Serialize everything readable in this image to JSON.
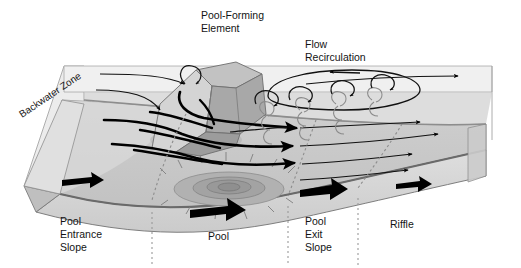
{
  "figure": {
    "title_visible": false,
    "type": "block-diagram",
    "background_color": "#ffffff"
  },
  "labels": {
    "pool_forming_element": {
      "line1": "Pool-Forming",
      "line2": "Element"
    },
    "flow_recirculation": {
      "line1": "Flow",
      "line2": "Recirculation"
    },
    "backwater_zone": "Backwater Zone",
    "pool_entrance_slope": {
      "line1": "Pool",
      "line2": "Entrance",
      "line3": "Slope"
    },
    "pool": "Pool",
    "pool_exit_slope": {
      "line1": "Pool",
      "line2": "Exit",
      "line3": "Slope"
    },
    "riffle": "Riffle"
  },
  "zones": [
    {
      "name": "Pool Entrance Slope",
      "order": 1
    },
    {
      "name": "Pool",
      "order": 2
    },
    {
      "name": "Pool Exit Slope",
      "order": 3
    },
    {
      "name": "Riffle",
      "order": 4
    }
  ],
  "colors": {
    "block_top_light": "#e9e9e9",
    "block_top_mid": "#cfcfcf",
    "block_bed": "#c6c6c6",
    "block_front_face": "#d8d8d8",
    "block_side_face": "#e4e4e4",
    "water_surface": "#efefef",
    "boulder_light": "#d2d2d2",
    "boulder_mid": "#b4b4b4",
    "boulder_dark": "#9b9b9b",
    "pool_ring_outer": "#b0b0b0",
    "pool_ring_mid": "#a0a0a0",
    "pool_ring_inner": "#949494",
    "flow_line": "#000000",
    "eddy_line": "#8c8c8c",
    "divider_dotted": "#9a9a9a",
    "text": "#141414",
    "outline": "#6f6f6f"
  },
  "elements": {
    "flow_arrows_thick_count": 5,
    "flow_arrows_thin_count": 6,
    "recirculation_eddies_count": 12,
    "bed_arrows_count": 4,
    "pool_depression_rings": 4,
    "divider_lines_count": 3
  }
}
